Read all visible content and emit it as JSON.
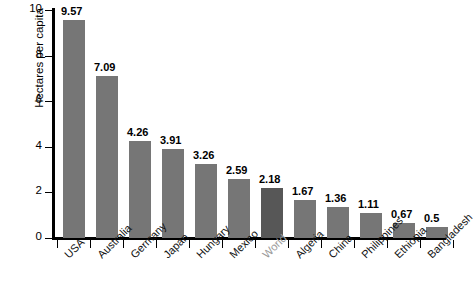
{
  "chart_data": {
    "type": "bar",
    "title": "",
    "xlabel": "",
    "ylabel": "Hectares per capita",
    "ylim": [
      0,
      10
    ],
    "yticks": [
      0,
      2,
      4,
      6,
      8,
      10
    ],
    "grid": false,
    "legend": "none",
    "categories": [
      "USA",
      "Australia",
      "Germany",
      "Japan",
      "Hungary",
      "Mexico",
      "World",
      "Algeria",
      "China",
      "Philippines",
      "Ethiopia",
      "Bangladesh"
    ],
    "values": [
      9.57,
      7.09,
      4.26,
      3.91,
      3.26,
      2.59,
      2.18,
      1.67,
      1.36,
      1.11,
      0.67,
      0.5
    ],
    "value_labels": [
      "9.57",
      "7.09",
      "4.26",
      "3.91",
      "3.26",
      "2.59",
      "2.18",
      "1.67",
      "1.36",
      "1.11",
      "0.67",
      "0.5"
    ],
    "highlight_category": "World",
    "colors": {
      "bar": "#767676",
      "bar_highlight": "#575757",
      "axis": "#000000",
      "text": "#000000",
      "muted_text": "#9a9a9a",
      "background": "#ffffff"
    }
  }
}
